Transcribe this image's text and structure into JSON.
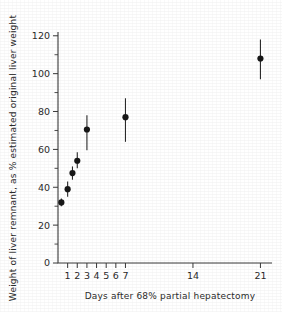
{
  "chart_data": {
    "type": "scatter",
    "title": "",
    "xlabel": "Days after 68% partial hepatectomy",
    "ylabel": "Weight of liver remnant, as % estimated original liver weight",
    "xlim": [
      0,
      22.2
    ],
    "ylim": [
      0,
      122
    ],
    "grid": false,
    "legend": null,
    "y_ticks": [
      0,
      20,
      40,
      60,
      80,
      100,
      120
    ],
    "y_tick_labels": [
      "0",
      "20",
      "40",
      "60",
      "80",
      "100",
      "120"
    ],
    "y_minor_ticks": [
      10,
      30,
      50,
      70,
      90,
      110
    ],
    "x_ticks": [
      1,
      2,
      3,
      4,
      5,
      6,
      7,
      14,
      21
    ],
    "x_tick_labels": [
      "1",
      "2",
      "3",
      "4",
      "5",
      "6",
      "7",
      "14",
      "21"
    ],
    "marker": "filled-circle",
    "error_bars": "vertical, no caps",
    "points": [
      {
        "x": 0.35,
        "y": 32,
        "yerr_low": 30,
        "yerr_high": 34
      },
      {
        "x": 1.0,
        "y": 39,
        "yerr_low": 35,
        "yerr_high": 43
      },
      {
        "x": 1.5,
        "y": 47.5,
        "yerr_low": 44,
        "yerr_high": 51
      },
      {
        "x": 2.0,
        "y": 54,
        "yerr_low": 50,
        "yerr_high": 58.5
      },
      {
        "x": 3.0,
        "y": 70.5,
        "yerr_low": 59.5,
        "yerr_high": 78
      },
      {
        "x": 7.0,
        "y": 77,
        "yerr_low": 64,
        "yerr_high": 87
      },
      {
        "x": 21.0,
        "y": 108,
        "yerr_low": 97,
        "yerr_high": 118
      }
    ]
  },
  "figure": {
    "axis_color": "#3a3a3a",
    "marker_color": "#171717",
    "background": "#ffffff"
  }
}
